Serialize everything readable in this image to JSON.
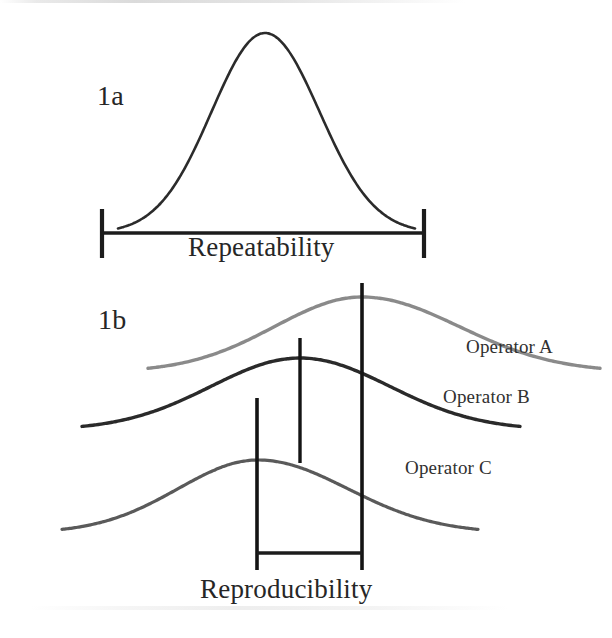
{
  "figure": {
    "background_color": "#ffffff"
  },
  "panel_a": {
    "tag": "1a",
    "caption": "Repeatability",
    "curve_color": "#2b2b2b",
    "bracket_color": "#1c1c1c"
  },
  "panel_b": {
    "tag": "1b",
    "caption": "Reproducibility",
    "bracket_color": "#1c1c1c",
    "series": [
      {
        "label": "Operator A",
        "color": "#8a8a8a"
      },
      {
        "label": "Operator B",
        "color": "#2a2a2a"
      },
      {
        "label": "Operator C",
        "color": "#5a5a5a"
      }
    ]
  },
  "chart_data": {
    "type": "line",
    "xlabel": "",
    "ylabel": "",
    "grid": false,
    "legend": "inline-right",
    "panels": [
      {
        "id": "1a",
        "tag": "1a",
        "caption": "Repeatability",
        "description": "Single normal distribution curve with a horizontal spread bracket beneath it",
        "series": [
          {
            "name": "Repeatability distribution",
            "color": "#2b2b2b",
            "type": "normal-curve",
            "peak_x": 265,
            "peak_y": 33,
            "baseline_y": 233,
            "left_x": 118,
            "right_x": 415
          }
        ],
        "bracket": {
          "label": "Repeatability",
          "left_x": 102,
          "right_x": 424,
          "line_y": 233,
          "tick_top_y": 209,
          "tick_bottom_y": 258
        }
      },
      {
        "id": "1b",
        "tag": "1b",
        "caption": "Reproducibility",
        "description": "Three offset operator distribution curves with vertical peak markers and a reproducibility spread bracket spanning the extreme peaks",
        "series": [
          {
            "name": "Operator A",
            "color": "#8a8a8a",
            "type": "normal-curve",
            "peak_x": 362,
            "peak_y": 297,
            "baseline_y": 372,
            "left_x": 148,
            "right_x": 600,
            "marker_line": {
              "x": 362,
              "top_y": 283,
              "bottom_y": 570
            }
          },
          {
            "name": "Operator B",
            "color": "#2a2a2a",
            "type": "normal-curve",
            "peak_x": 300,
            "peak_y": 358,
            "baseline_y": 430,
            "left_x": 82,
            "right_x": 520,
            "marker_line": {
              "x": 300,
              "top_y": 338,
              "bottom_y": 463
            }
          },
          {
            "name": "Operator C",
            "color": "#5a5a5a",
            "type": "normal-curve",
            "peak_x": 258,
            "peak_y": 460,
            "baseline_y": 533,
            "left_x": 62,
            "right_x": 478,
            "marker_line": {
              "x": 257,
              "top_y": 398,
              "bottom_y": 570
            }
          }
        ],
        "bracket": {
          "label": "Reproducibility",
          "left_x": 257,
          "right_x": 362,
          "line_y": 553,
          "tick_bottom_y": 572
        }
      }
    ]
  }
}
